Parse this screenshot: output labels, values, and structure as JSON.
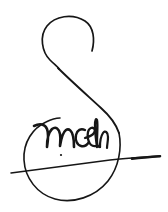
{
  "canvas": {
    "width": 168,
    "height": 212,
    "background_color": "#ffffff",
    "ink_color": "#161616",
    "medium": "pen-ink-handwriting"
  },
  "signature": {
    "transcription": "mcelh",
    "description": "handwritten ink signature",
    "strokes": [
      {
        "name": "upper-loop",
        "label": "S upper loop",
        "path": "M 92 51 C 95 40 94 27 85 21 C 72 13 55 16 47 26 C 39 36 42 52 50 60 C 55 65 58 67 59 69"
      },
      {
        "name": "main-diagonal",
        "label": "S descending diagonal",
        "path": "M 58 68 C 70 80 88 96 101 108 C 110 116 116 124 119 133"
      },
      {
        "name": "lower-loop",
        "label": "S lower circular loop",
        "path": "M 119 133 C 122 148 119 167 108 181 C 95 197 73 204 55 199 C 37 194 25 178 24 160 C 23 142 33 128 46 122 C 52 119 57 118 60 118"
      },
      {
        "name": "letter-m",
        "label": "cursive m",
        "path": "M 34 126 C 40 123 45 124 47 129 C 49 134 48 141 47 147 C 47 141 48 133 52 129 C 56 126 59 129 60 134 C 61 139 60 143 60 146 C 61 140 62 133 66 130 C 69 128 72 131 73 136 C 74 140 74 144 74 147"
      },
      {
        "name": "letter-c",
        "label": "cursive c",
        "path": "M 85 130 C 81 128 77 130 76 135 C 75 140 77 145 81 146 C 84 147 87 145 89 142"
      },
      {
        "name": "letter-e",
        "label": "cursive e",
        "path": "M 85 138 C 88 137 92 136 94 133 C 96 130 94 127 91 128 C 88 129 87 134 88 139 C 89 144 92 147 96 146"
      },
      {
        "name": "letter-l",
        "label": "cursive l ascender",
        "path": "M 97 147 C 96 140 95 132 95 125 C 95 120 96 118 97 120 C 98 124 97 134 97 141 C 97 145 98 147 100 147"
      },
      {
        "name": "letter-h",
        "label": "cursive h terminal",
        "path": "M 100 147 C 100 141 101 136 103 133 C 105 130 108 132 108 137 C 108 142 107 145 107 148"
      },
      {
        "name": "underline",
        "label": "long underline flourish",
        "path": "M 11 173 C 40 169 80 164 110 160 C 130 158 148 157 160 156"
      }
    ],
    "accents": [
      {
        "name": "underline-tip",
        "label": "thick right terminal of underline"
      },
      {
        "name": "m-dot",
        "label": "small ink dot below m"
      }
    ]
  }
}
